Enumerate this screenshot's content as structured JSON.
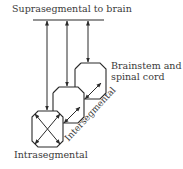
{
  "diagram": {
    "title": "Suprasegmental to brain",
    "levels": [
      {
        "id": "intrasegmental",
        "label": "Intrasegmental"
      },
      {
        "id": "intersegmental",
        "label": "Intersegmental"
      },
      {
        "id": "brainstem",
        "label_line1": "Brainstem and",
        "label_line2": "spinal cord"
      }
    ],
    "colors": {
      "stroke": "#2b2b2b",
      "text": "#3a3a3a",
      "background": "#ffffff"
    }
  }
}
